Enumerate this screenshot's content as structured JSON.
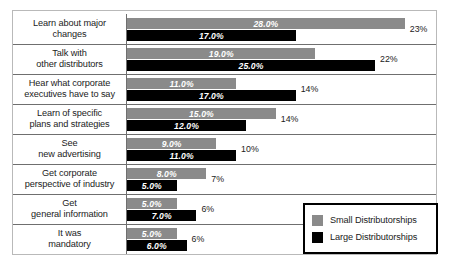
{
  "chart_data": {
    "type": "bar",
    "title": "",
    "xlabel": "",
    "ylabel": "",
    "orientation": "horizontal",
    "grid": false,
    "legend_position": "bottom-right",
    "xlim": [
      0,
      30
    ],
    "categories": [
      "Learn about major changes",
      "Talk with other distributors",
      "Hear what corporate executives have to say",
      "Learn of specific plans and strategies",
      "See new advertising",
      "Get corporate perspective of industry",
      "Get general information",
      "It was mandatory"
    ],
    "series": [
      {
        "name": "Small Distributorships",
        "color": "#8a8a8a",
        "values": [
          28.0,
          19.0,
          11.0,
          15.0,
          9.0,
          8.0,
          5.0,
          5.0
        ],
        "value_labels": [
          "28.0%",
          "19.0%",
          "11.0%",
          "15.0%",
          "9.0%",
          "8.0%",
          "5.0%",
          "5.0%"
        ]
      },
      {
        "name": "Large Distributorships",
        "color": "#000000",
        "values": [
          17.0,
          25.0,
          17.0,
          12.0,
          11.0,
          5.0,
          7.0,
          6.0
        ],
        "value_labels": [
          "17.0%",
          "25.0%",
          "17.0%",
          "12.0%",
          "11.0%",
          "5.0%",
          "7.0%",
          "6.0%"
        ]
      }
    ],
    "totals": [
      23,
      22,
      14,
      14,
      10,
      7,
      6,
      6
    ],
    "total_labels": [
      "23%",
      "22%",
      "14%",
      "14%",
      "10%",
      "7%",
      "6%",
      "6%"
    ]
  },
  "rows": [
    {
      "label_lines": [
        "Learn about major",
        "changes"
      ],
      "small_label": "28.0%",
      "large_label": "17.0%",
      "total_label": "23%"
    },
    {
      "label_lines": [
        "Talk with",
        "other distributors"
      ],
      "small_label": "19.0%",
      "large_label": "25.0%",
      "total_label": "22%"
    },
    {
      "label_lines": [
        "Hear what corporate",
        "executives have to say"
      ],
      "small_label": "11.0%",
      "large_label": "17.0%",
      "total_label": "14%"
    },
    {
      "label_lines": [
        "Learn of specific",
        "plans and strategies"
      ],
      "small_label": "15.0%",
      "large_label": "12.0%",
      "total_label": "14%"
    },
    {
      "label_lines": [
        "See",
        "new advertising"
      ],
      "small_label": "9.0%",
      "large_label": "11.0%",
      "total_label": "10%"
    },
    {
      "label_lines": [
        "Get corporate",
        "perspective of industry"
      ],
      "small_label": "8.0%",
      "large_label": "5.0%",
      "total_label": "7%"
    },
    {
      "label_lines": [
        "Get",
        "general information"
      ],
      "small_label": "5.0%",
      "large_label": "7.0%",
      "total_label": "6%"
    },
    {
      "label_lines": [
        "It was",
        "mandatory"
      ],
      "small_label": "5.0%",
      "large_label": "6.0%",
      "total_label": "6%"
    }
  ],
  "legend": {
    "items": [
      {
        "label": "Small Distributorships",
        "color": "#8a8a8a"
      },
      {
        "label": "Large Distributorships",
        "color": "#000000"
      }
    ]
  }
}
